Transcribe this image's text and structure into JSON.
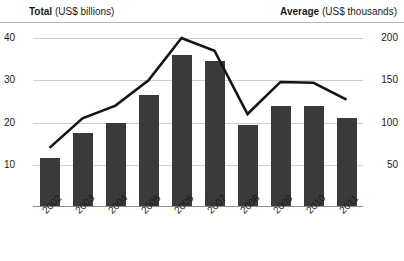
{
  "header": {
    "left_bold": "Total",
    "left_unit": " (US$ billions)",
    "right_bold": "Average",
    "right_unit": " (US$ thousands)"
  },
  "axes": {
    "left_ticks": [
      "40",
      "30",
      "20",
      "10"
    ],
    "right_ticks": [
      "200",
      "150",
      "100",
      "50"
    ]
  },
  "chart_data": {
    "type": "bar",
    "title": "",
    "subtitle": "",
    "xlabel": "",
    "ylabel": "Total (US$ billions)",
    "y2label": "Average (US$ thousands)",
    "categories": [
      "2002",
      "2003",
      "2004",
      "2005",
      "2006",
      "2007",
      "2008",
      "2009",
      "2010",
      "2011"
    ],
    "ylim": [
      0,
      40
    ],
    "y2lim": [
      0,
      200
    ],
    "yticks": [
      10,
      20,
      30,
      40
    ],
    "y2ticks": [
      50,
      100,
      150,
      200
    ],
    "grid": true,
    "legend_position": "none",
    "bar_color": "#3a3a3a",
    "line_color": "#141414",
    "series": [
      {
        "name": "Total",
        "type": "bar",
        "axis": "left",
        "unit": "US$ billions",
        "values": [
          11.5,
          17.5,
          20.0,
          26.5,
          36.0,
          34.5,
          19.5,
          24.0,
          24.0,
          21.0
        ]
      },
      {
        "name": "Average",
        "type": "line",
        "axis": "right",
        "unit": "US$ thousands",
        "values": [
          70,
          105,
          120,
          150,
          200,
          185,
          110,
          148,
          147,
          127
        ]
      }
    ]
  }
}
